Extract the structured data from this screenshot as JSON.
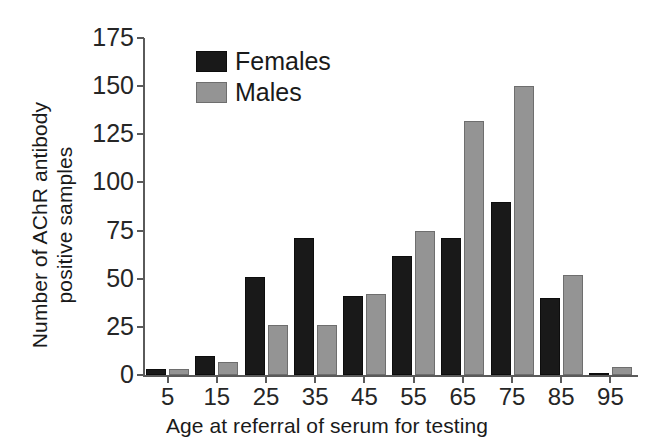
{
  "chart_data": {
    "type": "bar",
    "title": "",
    "xlabel": "Age at referral of serum for testing",
    "ylabel": "Number of AChR antibody positive samples",
    "ylabel_line1": "Number of AChR antibody",
    "ylabel_line2": "positive samples",
    "categories": [
      "5",
      "15",
      "25",
      "35",
      "45",
      "55",
      "65",
      "75",
      "85",
      "95"
    ],
    "series": [
      {
        "name": "Females",
        "color": "#191919",
        "values": [
          3,
          10,
          51,
          71,
          41,
          62,
          71,
          90,
          40,
          1
        ]
      },
      {
        "name": "Males",
        "color": "#949494",
        "values": [
          3,
          7,
          26,
          26,
          42,
          75,
          132,
          150,
          52,
          4
        ]
      }
    ],
    "ylim": [
      0,
      175
    ],
    "yticks": [
      "0",
      "25",
      "50",
      "75",
      "100",
      "125",
      "150",
      "175"
    ],
    "ytick_values": [
      0,
      25,
      50,
      75,
      100,
      125,
      150,
      175
    ],
    "grid": false,
    "legend_position": "top-left-inside",
    "legend": [
      "Females",
      "Males"
    ],
    "axis_color": "#5a5a5a",
    "background": "#ffffff"
  }
}
